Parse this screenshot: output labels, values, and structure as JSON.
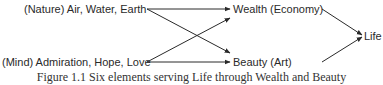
{
  "diagram": {
    "sources": [
      {
        "id": "nature",
        "label": "(Nature) Air, Water, Earth"
      },
      {
        "id": "mind",
        "label": "(Mind) Admiration, Hope, Love"
      }
    ],
    "intermediates": [
      {
        "id": "wealth",
        "label": "Wealth (Economy)"
      },
      {
        "id": "beauty",
        "label": "Beauty (Art)"
      }
    ],
    "target": {
      "id": "life",
      "label": "Life"
    },
    "edges": [
      {
        "from": "nature",
        "to": "wealth"
      },
      {
        "from": "nature",
        "to": "beauty"
      },
      {
        "from": "mind",
        "to": "wealth"
      },
      {
        "from": "mind",
        "to": "beauty"
      },
      {
        "from": "wealth",
        "to": "life"
      },
      {
        "from": "beauty",
        "to": "life"
      }
    ],
    "line_color": "#2a2a2a"
  },
  "caption": "Figure 1.1  Six elements serving Life through Wealth and Beauty"
}
